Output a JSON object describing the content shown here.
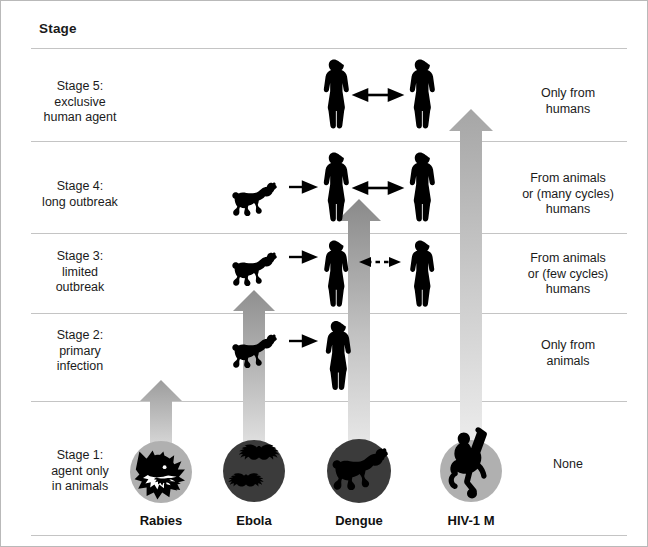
{
  "figure": {
    "header": "Stage",
    "background": "#ffffff",
    "border_color": "#b9b9b9",
    "silhouette_color": "#000000",
    "medallion_fill_light": "#b0b0b0",
    "medallion_fill_dark": "#3a3a3a",
    "arrow_gradient_top": "#a8a8a8",
    "arrow_gradient_bottom": "#e8e8e8",
    "rule_color": "#c4c4c4"
  },
  "rows": [
    {
      "id": "stage5",
      "stage_label": "Stage 5:\nexclusive\nhuman agent",
      "transmission": "Only from\nhumans",
      "top": 47,
      "height": 93
    },
    {
      "id": "stage4",
      "stage_label": "Stage 4:\nlong outbreak",
      "transmission": "From animals\nor (many cycles)\nhumans",
      "top": 140,
      "height": 92
    },
    {
      "id": "stage3",
      "stage_label": "Stage 3:\nlimited\noutbreak",
      "transmission": "From animals\nor (few cycles)\nhumans",
      "top": 232,
      "height": 80
    },
    {
      "id": "stage2",
      "stage_label": "Stage 2:\nprimary\ninfection",
      "transmission": "Only from\nanimals",
      "top": 312,
      "height": 88
    },
    {
      "id": "stage1",
      "stage_label": "Stage 1:\nagent only\nin animals",
      "transmission": "None",
      "top": 400,
      "height": 110
    }
  ],
  "columns": [
    {
      "id": "rabies",
      "name": "Rabies",
      "center_x": 160,
      "animal_icon": "wolf-head-icon",
      "medallion_tone": "light",
      "reaches_stage": 2,
      "arrow_tip_y": 383,
      "arrow_base_y": 470,
      "arrow_width": 22
    },
    {
      "id": "ebola",
      "name": "Ebola",
      "center_x": 253,
      "animal_icon": "bats-icon",
      "medallion_tone": "dark",
      "reaches_stage": 3,
      "arrow_tip_y": 293,
      "arrow_base_y": 470,
      "arrow_width": 22
    },
    {
      "id": "dengue",
      "name": "Dengue",
      "center_x": 358,
      "animal_icon": "monkey-icon",
      "medallion_tone": "dark",
      "reaches_stage": 4,
      "arrow_tip_y": 202,
      "arrow_base_y": 470,
      "arrow_width": 22
    },
    {
      "id": "hiv1m",
      "name": "HIV-1 M",
      "center_x": 470,
      "animal_icon": "ape-icon",
      "medallion_tone": "light",
      "reaches_stage": 5,
      "arrow_tip_y": 112,
      "arrow_base_y": 470,
      "arrow_width": 22
    }
  ],
  "scene_elements": {
    "stage5": {
      "humans": [
        "human-silhouette",
        "human-silhouette"
      ],
      "connector": "double-headed-solid-arrow"
    },
    "stage4": {
      "animal": "monkey-silhouette",
      "humans": [
        "human-silhouette",
        "human-silhouette"
      ],
      "connectors": [
        "single-headed-solid-arrow",
        "double-headed-solid-arrow"
      ]
    },
    "stage3": {
      "animal": "monkey-silhouette",
      "humans": [
        "human-silhouette",
        "human-silhouette"
      ],
      "connectors": [
        "single-headed-solid-arrow",
        "double-headed-dashed-arrow"
      ]
    },
    "stage2": {
      "animal": "monkey-silhouette",
      "humans": [
        "human-silhouette"
      ],
      "connectors": [
        "single-headed-solid-arrow"
      ]
    },
    "stage1": {
      "medallions": [
        "wolf-head-icon",
        "bats-icon",
        "monkey-icon",
        "ape-icon"
      ]
    }
  }
}
